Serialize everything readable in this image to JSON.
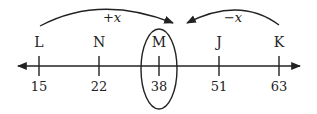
{
  "diagram": {
    "type": "number-line",
    "points": [
      {
        "label": "L",
        "value": "15",
        "x": 39
      },
      {
        "label": "N",
        "value": "22",
        "x": 99
      },
      {
        "label": "M",
        "value": "38",
        "x": 159
      },
      {
        "label": "J",
        "value": "51",
        "x": 219
      },
      {
        "label": "K",
        "value": "63",
        "x": 279
      }
    ],
    "arrows": [
      {
        "name": "left-arc",
        "label": "+x"
      },
      {
        "name": "right-arc",
        "label": "−x"
      }
    ],
    "highlighted": "M",
    "colors": {
      "stroke": "#222222",
      "background": "#ffffff"
    }
  }
}
